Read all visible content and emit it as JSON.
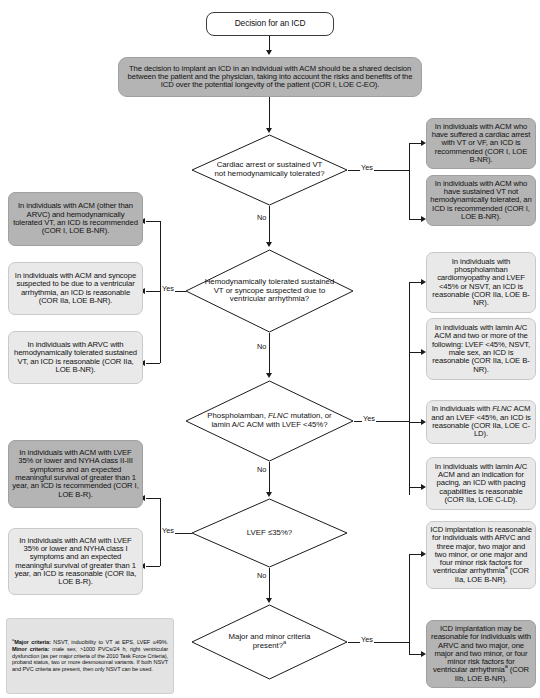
{
  "title": "Decision for an ICD",
  "shared_decision": "The decision to implant an ICD in an individual with ACM should be a shared decision between the patient and the physician, taking into account the risks and benefits of the ICD over the potential longevity of the patient (COR I, LOE C-EO).",
  "labels": {
    "yes": "Yes",
    "no": "No"
  },
  "decisions": {
    "d1": "Cardiac arrest or sustained VT not hemodynamically tolerated?",
    "d2": "Hemodynamically tolerated sustained VT or syncope suspected due to ventricular arrhythmia?",
    "d3": "Phospholamban, FLNC mutation, or lamin A/C ACM with LVEF <45%?",
    "d4": "LVEF ≤35%?",
    "d5": "Major and minor criteria present?a"
  },
  "outcomes": {
    "o1a": "In individuals with ACM who have suffered a cardiac arrest with VT or VF, an ICD is recommended (COR I, LOE B-NR).",
    "o1b": "In individuals with ACM who have sustained VT not hemodynamically tolerated, an ICD is recommended (COR I, LOE B-NR).",
    "o2a": "In individuals with ACM (other than ARVC) and hemodynamically tolerated VT, an ICD is recommended (COR I, LOE B-NR).",
    "o2b": "In individuals with ACM and syncope suspected to be due to a ventricular arrhythmia, an ICD is reasonable (COR IIa, LOE B-NR).",
    "o2c": "In individuals with ARVC with hemodynamically tolerated sustained VT, an ICD is reasonable (COR IIa, LOE B-NR).",
    "o3a": "In individuals with phospholamban cardiomyopathy and LVEF <45% or NSVT, an ICD is reasonable (COR IIa, LOE B-NR).",
    "o3b": "In individuals with lamin A/C ACM and two or more of the following: LVEF <45%, NSVT, male sex, an ICD is reasonable (COR IIa, LOE B-NR).",
    "o3c": "In individuals with FLNC ACM and an LVEF <45%, an ICD is reasonable (COR IIa, LOE C-LD).",
    "o3d": "In individuals with lamin A/C ACM and an indication for pacing, an ICD with pacing capabilities is reasonable (COR IIa, LOE C-LD).",
    "o4a": "In individuals with ACM with LVEF 35% or lower and NYHA class II-III symptoms and an expected meaningful survival of greater than 1 year, an ICD is recommended (COR I, LOE B-R).",
    "o4b": "In individuals with ACM with LVEF 35% or lower and NYHA class I symptoms and an expected meaningful survival of greater than 1 year, an ICD is reasonable (COR IIa, LOE B-R).",
    "o5a": "ICD implantation is reasonable for individuals with ARVC and three major, two major and two minor, or one major and four minor risk factors for ventricular arrhythmiaa (COR IIa, LOE B-NR).",
    "o5b": "ICD implantation may be reasonable for individuals with ARVC and two major, one major and two minor, or four minor risk factors for ventricular arrhythmiaa (COR IIb, LOE B-NR)."
  },
  "footnote": "aMajor criteria: NSVT, inducibility to VT at EPS, LVEF ≤49%. Minor criteria: male sex, >1000 PVCs/24 h, right ventricular dysfunction (as per major criteria of the 2010 Task Force Criteria), proband status, two or more desmosomal variants. If both NSVT and PVC criteria are present, then only NSVT can be used.",
  "colors": {
    "shaded_dark": "#b4b4b4",
    "shaded_light": "#e9e9e9",
    "line": "#1b1b1b",
    "text": "#111111"
  }
}
